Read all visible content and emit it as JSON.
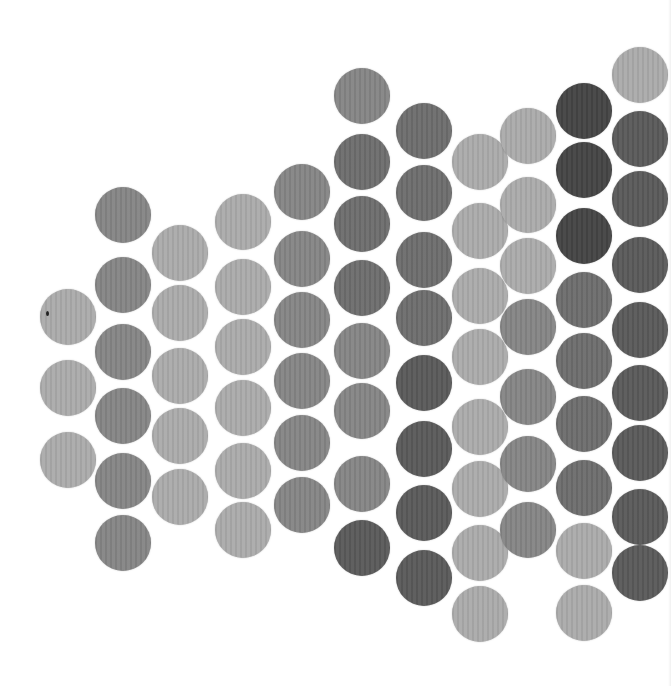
{
  "image": {
    "description": "Grid of gray circular paper dots arranged in staggered columns on white background, varying shades",
    "width": 671,
    "height": 686,
    "background": "#ffffff",
    "dot_diameter": 56
  },
  "palette": {
    "light": "#ababab",
    "medium": "#858585",
    "medium_dark": "#6d6d6d",
    "dark": "#5a5a5a",
    "darkest": "#444444"
  },
  "columns": [
    {
      "x": 68,
      "dots": [
        {
          "y": 317,
          "tone": "light"
        },
        {
          "y": 388,
          "tone": "light"
        },
        {
          "y": 460,
          "tone": "light"
        }
      ]
    },
    {
      "x": 123,
      "dots": [
        {
          "y": 215,
          "tone": "medium"
        },
        {
          "y": 285,
          "tone": "medium"
        },
        {
          "y": 352,
          "tone": "medium"
        },
        {
          "y": 416,
          "tone": "medium"
        },
        {
          "y": 481,
          "tone": "medium"
        },
        {
          "y": 543,
          "tone": "medium"
        }
      ]
    },
    {
      "x": 180,
      "dots": [
        {
          "y": 253,
          "tone": "light"
        },
        {
          "y": 313,
          "tone": "light"
        },
        {
          "y": 376,
          "tone": "light"
        },
        {
          "y": 436,
          "tone": "light"
        },
        {
          "y": 497,
          "tone": "light"
        }
      ]
    },
    {
      "x": 243,
      "dots": [
        {
          "y": 222,
          "tone": "light"
        },
        {
          "y": 287,
          "tone": "light"
        },
        {
          "y": 347,
          "tone": "light"
        },
        {
          "y": 408,
          "tone": "light"
        },
        {
          "y": 471,
          "tone": "light"
        },
        {
          "y": 530,
          "tone": "light"
        }
      ]
    },
    {
      "x": 302,
      "dots": [
        {
          "y": 192,
          "tone": "medium"
        },
        {
          "y": 259,
          "tone": "medium"
        },
        {
          "y": 320,
          "tone": "medium"
        },
        {
          "y": 381,
          "tone": "medium"
        },
        {
          "y": 443,
          "tone": "medium"
        },
        {
          "y": 505,
          "tone": "medium"
        }
      ]
    },
    {
      "x": 362,
      "dots": [
        {
          "y": 96,
          "tone": "medium"
        },
        {
          "y": 162,
          "tone": "medium_dark"
        },
        {
          "y": 224,
          "tone": "medium_dark"
        },
        {
          "y": 288,
          "tone": "medium_dark"
        },
        {
          "y": 351,
          "tone": "medium"
        },
        {
          "y": 411,
          "tone": "medium"
        },
        {
          "y": 484,
          "tone": "medium"
        },
        {
          "y": 548,
          "tone": "dark"
        }
      ]
    },
    {
      "x": 424,
      "dots": [
        {
          "y": 131,
          "tone": "medium_dark"
        },
        {
          "y": 193,
          "tone": "medium_dark"
        },
        {
          "y": 260,
          "tone": "medium_dark"
        },
        {
          "y": 318,
          "tone": "medium_dark"
        },
        {
          "y": 383,
          "tone": "dark"
        },
        {
          "y": 449,
          "tone": "dark"
        },
        {
          "y": 513,
          "tone": "dark"
        },
        {
          "y": 578,
          "tone": "dark"
        }
      ]
    },
    {
      "x": 480,
      "dots": [
        {
          "y": 162,
          "tone": "light"
        },
        {
          "y": 231,
          "tone": "light"
        },
        {
          "y": 296,
          "tone": "light"
        },
        {
          "y": 357,
          "tone": "light"
        },
        {
          "y": 427,
          "tone": "light"
        },
        {
          "y": 489,
          "tone": "light"
        },
        {
          "y": 553,
          "tone": "light"
        },
        {
          "y": 614,
          "tone": "light"
        }
      ]
    },
    {
      "x": 528,
      "dots": [
        {
          "y": 136,
          "tone": "light"
        },
        {
          "y": 205,
          "tone": "light"
        },
        {
          "y": 266,
          "tone": "light"
        },
        {
          "y": 327,
          "tone": "medium"
        },
        {
          "y": 397,
          "tone": "medium"
        },
        {
          "y": 464,
          "tone": "medium"
        },
        {
          "y": 530,
          "tone": "medium"
        }
      ]
    },
    {
      "x": 584,
      "dots": [
        {
          "y": 111,
          "tone": "darkest"
        },
        {
          "y": 170,
          "tone": "darkest"
        },
        {
          "y": 236,
          "tone": "darkest"
        },
        {
          "y": 300,
          "tone": "medium_dark"
        },
        {
          "y": 361,
          "tone": "medium_dark"
        },
        {
          "y": 424,
          "tone": "medium_dark"
        },
        {
          "y": 488,
          "tone": "medium_dark"
        },
        {
          "y": 551,
          "tone": "light"
        },
        {
          "y": 613,
          "tone": "light"
        }
      ]
    },
    {
      "x": 640,
      "dots": [
        {
          "y": 75,
          "tone": "light"
        },
        {
          "y": 139,
          "tone": "dark"
        },
        {
          "y": 199,
          "tone": "dark"
        },
        {
          "y": 265,
          "tone": "dark"
        },
        {
          "y": 330,
          "tone": "dark"
        },
        {
          "y": 393,
          "tone": "dark"
        },
        {
          "y": 453,
          "tone": "dark"
        },
        {
          "y": 517,
          "tone": "dark"
        },
        {
          "y": 573,
          "tone": "dark"
        }
      ]
    }
  ]
}
